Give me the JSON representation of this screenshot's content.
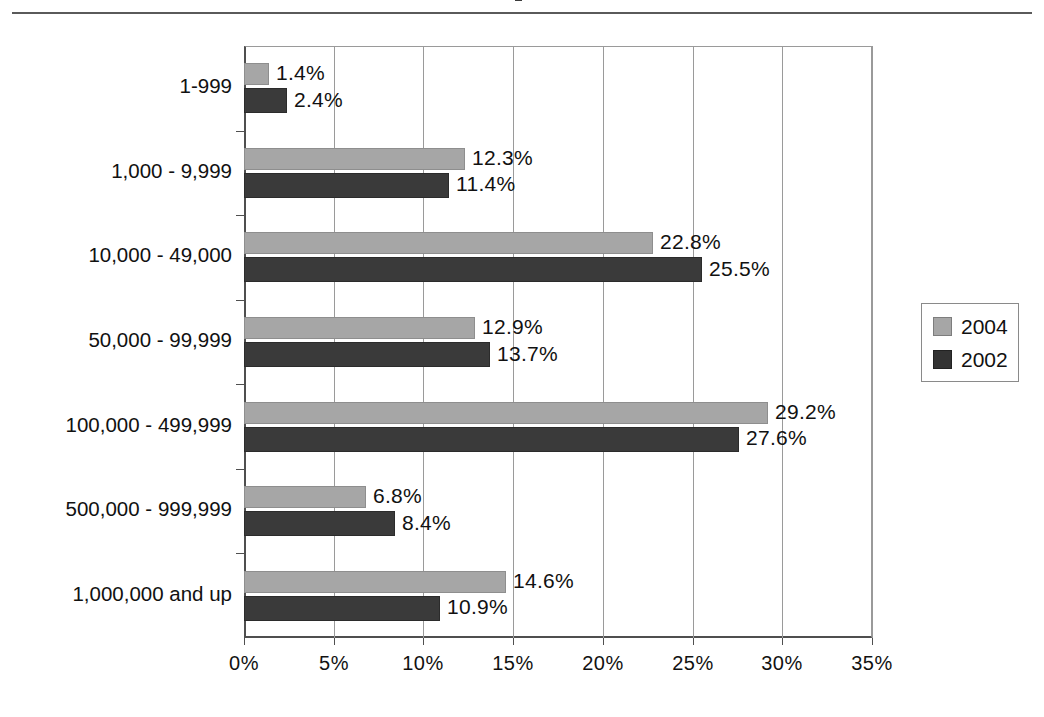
{
  "page": {
    "background_color": "#ffffff",
    "top_rule_color": "#5a5a5a"
  },
  "chart_data": {
    "type": "bar",
    "orientation": "horizontal",
    "title": "",
    "subtitle": "",
    "xlabel": "",
    "ylabel": "",
    "xlim": [
      0,
      35
    ],
    "xticks": [
      0,
      5,
      10,
      15,
      20,
      25,
      30,
      35
    ],
    "xtick_labels": [
      "0%",
      "5%",
      "10%",
      "15%",
      "20%",
      "25%",
      "30%",
      "35%"
    ],
    "grid": "vertical",
    "legend_position": "right",
    "categories": [
      "1-999",
      "1,000 - 9,999",
      "10,000 - 49,000",
      "50,000 - 99,999",
      "100,000 - 499,999",
      "500,000 - 999,999",
      "1,000,000 and up"
    ],
    "series": [
      {
        "name": "2004",
        "color": "#a6a6a6",
        "values": [
          1.4,
          12.3,
          22.8,
          12.9,
          29.2,
          6.8,
          14.6
        ],
        "labels": [
          "1.4%",
          "12.3%",
          "22.8%",
          "12.9%",
          "29.2%",
          "6.8%",
          "14.6%"
        ]
      },
      {
        "name": "2002",
        "color": "#3a3a3a",
        "values": [
          2.4,
          11.4,
          25.5,
          13.7,
          27.6,
          8.4,
          10.9
        ],
        "labels": [
          "2.4%",
          "11.4%",
          "25.5%",
          "13.7%",
          "27.6%",
          "8.4%",
          "10.9%"
        ]
      }
    ]
  },
  "legend": {
    "entries": [
      {
        "label": "2004",
        "swatch": "light"
      },
      {
        "label": "2002",
        "swatch": "dark"
      }
    ]
  }
}
